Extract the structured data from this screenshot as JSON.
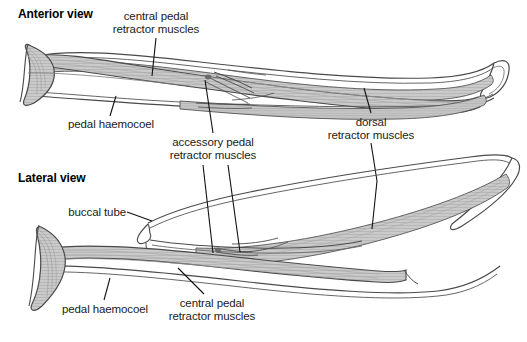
{
  "figure": {
    "background_color": "#ffffff",
    "outline_color": "#3a3a3a",
    "fill_color": "#c9c9c9",
    "text_color": "#1a1a1a",
    "width": 527,
    "height": 342
  },
  "panels": [
    {
      "id": "anterior",
      "view_label": "Anterior view"
    },
    {
      "id": "lateral",
      "view_label": "Lateral view"
    }
  ],
  "labels": {
    "anterior_view": "Anterior view",
    "lateral_view": "Lateral view",
    "central_pedal_retractor_muscles_top_line1": "central pedal",
    "central_pedal_retractor_muscles_top_line2": "retractor muscles",
    "pedal_haemocoel_top": "pedal haemocoel",
    "accessory_pedal_retractor_muscles_line1": "accessory pedal",
    "accessory_pedal_retractor_muscles_line2": "retractor muscles",
    "dorsal_retractor_muscles_line1": "dorsal",
    "dorsal_retractor_muscles_line2": "retractor muscles",
    "buccal_tube": "buccal tube",
    "pedal_haemocoel_bottom": "pedal haemocoel",
    "central_pedal_retractor_muscles_bottom_line1": "central pedal",
    "central_pedal_retractor_muscles_bottom_line2": "retractor muscles"
  }
}
